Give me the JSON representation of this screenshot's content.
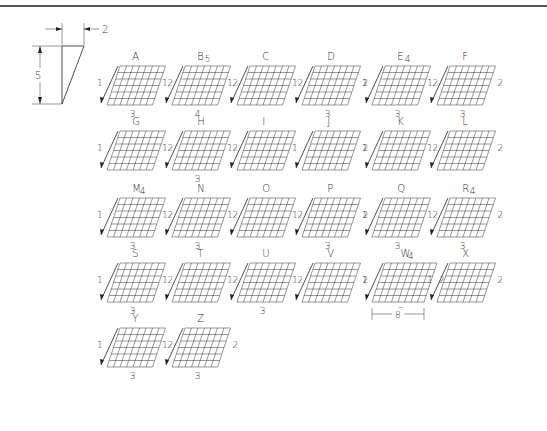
{
  "slant_guide": {
    "height_label": "5",
    "offset_label": "2"
  },
  "letters": [
    {
      "char": "A",
      "strokes": [
        "1",
        "2",
        "3"
      ]
    },
    {
      "char": "B",
      "strokes": [
        "1",
        "2",
        "4",
        "5"
      ]
    },
    {
      "char": "C",
      "strokes": [
        "1",
        "2"
      ]
    },
    {
      "char": "D",
      "strokes": [
        "1",
        "2",
        "3"
      ]
    },
    {
      "char": "E",
      "strokes": [
        "1",
        "2",
        "3",
        "4"
      ]
    },
    {
      "char": "F",
      "strokes": [
        "1",
        "2",
        "3"
      ]
    },
    {
      "char": "G",
      "strokes": [
        "1",
        "2"
      ]
    },
    {
      "char": "H",
      "strokes": [
        "1",
        "2",
        "3"
      ]
    },
    {
      "char": "I",
      "strokes": [
        "1"
      ]
    },
    {
      "char": "J",
      "strokes": [
        "1",
        "2"
      ]
    },
    {
      "char": "K",
      "strokes": [
        "1",
        "2"
      ]
    },
    {
      "char": "L",
      "strokes": [
        "1",
        "2"
      ]
    },
    {
      "char": "M",
      "strokes": [
        "1",
        "2",
        "3",
        "4"
      ]
    },
    {
      "char": "N",
      "strokes": [
        "1",
        "2",
        "3"
      ]
    },
    {
      "char": "O",
      "strokes": [
        "1",
        "2"
      ]
    },
    {
      "char": "P",
      "strokes": [
        "1",
        "2",
        "3"
      ]
    },
    {
      "char": "Q",
      "strokes": [
        "1",
        "2",
        "3"
      ]
    },
    {
      "char": "R",
      "strokes": [
        "1",
        "2",
        "3",
        "4"
      ]
    },
    {
      "char": "S",
      "strokes": [
        "1",
        "2",
        "3"
      ]
    },
    {
      "char": "T",
      "strokes": [
        "1",
        "2"
      ]
    },
    {
      "char": "U",
      "strokes": [
        "1",
        "2",
        "3"
      ]
    },
    {
      "char": "V",
      "strokes": [
        "1",
        "2"
      ]
    },
    {
      "char": "W",
      "strokes": [
        "1",
        "2",
        "3",
        "4"
      ],
      "width_label": "8"
    },
    {
      "char": "X",
      "strokes": [
        "1",
        "2"
      ]
    },
    {
      "char": "Y",
      "strokes": [
        "1",
        "2",
        "3"
      ]
    },
    {
      "char": "Z",
      "strokes": [
        "1",
        "2",
        "3"
      ]
    }
  ]
}
